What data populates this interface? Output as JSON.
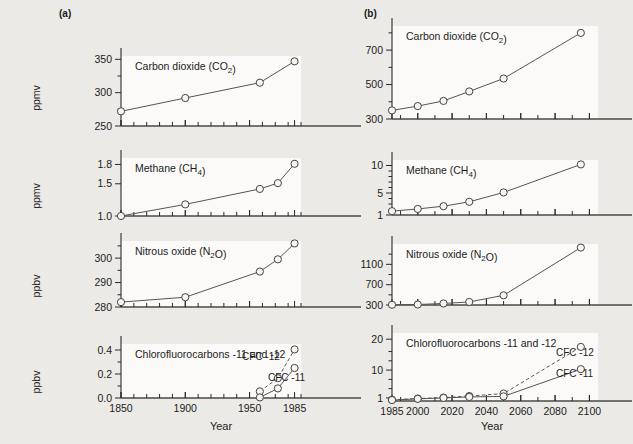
{
  "figure": {
    "panel_a_tag": "(a)",
    "panel_b_tag": "(b)",
    "xlabel": "Year"
  },
  "chart_data": [
    {
      "id": "a-co2",
      "type": "line",
      "panel": "(a)",
      "title": "Carbon dioxide (CO₂)",
      "xlabel": "Year",
      "ylabel": "ppmv",
      "xlim": [
        1850,
        1990
      ],
      "ylim": [
        250,
        355
      ],
      "yscale": "linear",
      "ytick_labels": [
        "250",
        "300",
        "350"
      ],
      "yticks": [
        250,
        300,
        350
      ],
      "yminor": [
        275,
        325
      ],
      "xtick_labels": [
        "1850",
        "1900",
        "1950",
        "1985"
      ],
      "xticks_labeled": [
        1850,
        1900,
        1950,
        1985
      ],
      "xminor": [
        1860,
        1870,
        1880,
        1890,
        1910,
        1920,
        1930,
        1940,
        1960,
        1970,
        1980
      ],
      "grid": false,
      "series": [
        {
          "name": "CO2",
          "style": "solid",
          "markers": true,
          "x": [
            1850,
            1900,
            1958,
            1985
          ],
          "values": [
            272,
            292,
            315,
            347
          ]
        }
      ]
    },
    {
      "id": "a-ch4",
      "type": "line",
      "panel": "(a)",
      "title": "Methane (CH₄)",
      "xlabel": "Year",
      "ylabel": "ppmv",
      "xlim": [
        1850,
        1990
      ],
      "ylim": [
        1.0,
        1.9
      ],
      "yscale": "linear",
      "ytick_labels": [
        "1.0",
        "1.5",
        "1.8"
      ],
      "yticks": [
        1.0,
        1.5,
        1.8
      ],
      "grid": false,
      "series": [
        {
          "name": "CH4",
          "style": "solid",
          "markers": true,
          "x": [
            1850,
            1900,
            1958,
            1972,
            1985
          ],
          "values": [
            1.0,
            1.18,
            1.42,
            1.51,
            1.81
          ]
        }
      ]
    },
    {
      "id": "a-n2o",
      "type": "line",
      "panel": "(a)",
      "title": "Nitrous oxide (N₂O)",
      "xlabel": "Year",
      "ylabel": "ppbv",
      "xlim": [
        1850,
        1990
      ],
      "ylim": [
        280,
        307
      ],
      "yscale": "linear",
      "ytick_labels": [
        "280",
        "290",
        "300"
      ],
      "yticks": [
        280,
        290,
        300
      ],
      "yminor": [
        285,
        295,
        305
      ],
      "grid": false,
      "series": [
        {
          "name": "N2O",
          "style": "solid",
          "markers": true,
          "x": [
            1850,
            1900,
            1958,
            1972,
            1985
          ],
          "values": [
            282,
            284,
            294.5,
            299.5,
            306
          ]
        }
      ]
    },
    {
      "id": "a-cfc",
      "type": "line",
      "panel": "(a)",
      "title": "Chlorofluorocarbons -11 and -12",
      "xlabel": "Year",
      "ylabel": "ppbv",
      "xlim": [
        1850,
        1990
      ],
      "ylim": [
        0.0,
        0.45
      ],
      "yscale": "linear",
      "ytick_labels": [
        "0.0",
        "0.2",
        "0.4"
      ],
      "yticks": [
        0.0,
        0.2,
        0.4
      ],
      "yminor": [
        0.1,
        0.3
      ],
      "grid": false,
      "series": [
        {
          "name": "CFC -12",
          "label": "CFC -12",
          "style": "dashed",
          "markers": true,
          "x": [
            1958,
            1972,
            1985
          ],
          "values": [
            0.055,
            0.165,
            0.405
          ]
        },
        {
          "name": "CFC -11",
          "label": "CFC -11",
          "style": "solid",
          "markers": true,
          "x": [
            1958,
            1972,
            1985
          ],
          "values": [
            0.005,
            0.08,
            0.25
          ]
        }
      ]
    },
    {
      "id": "b-co2",
      "type": "line",
      "panel": "(b)",
      "title": "Carbon dioxide (CO₂)",
      "xlabel": "Year",
      "ylabel": "",
      "xlim": [
        1985,
        2105
      ],
      "ylim": [
        300,
        840
      ],
      "yscale": "linear",
      "ytick_labels": [
        "300",
        "500",
        "700"
      ],
      "yticks": [
        300,
        500,
        700
      ],
      "yminor": [
        400,
        600,
        800
      ],
      "xtick_labels": [
        "1985",
        "2000",
        "2020",
        "2040",
        "2060",
        "2080",
        "2100"
      ],
      "xticks_labeled": [
        1985,
        2000,
        2020,
        2040,
        2060,
        2080,
        2100
      ],
      "grid": false,
      "series": [
        {
          "name": "CO2",
          "style": "solid",
          "markers": true,
          "x": [
            1985,
            2000,
            2015,
            2030,
            2050,
            2095
          ],
          "values": [
            350,
            375,
            405,
            460,
            535,
            800
          ]
        }
      ]
    },
    {
      "id": "b-ch4",
      "type": "line",
      "panel": "(b)",
      "title": "Methane (CH₄)",
      "xlabel": "Year",
      "ylabel": "",
      "xlim": [
        1985,
        2105
      ],
      "ylim": [
        1,
        11
      ],
      "yscale": "linear",
      "ytick_labels": [
        "1",
        "5",
        "10"
      ],
      "yticks": [
        1,
        5,
        10
      ],
      "yminor": [
        2,
        3,
        4,
        6,
        7,
        8,
        9
      ],
      "grid": false,
      "series": [
        {
          "name": "CH4",
          "style": "solid",
          "markers": true,
          "x": [
            1985,
            2000,
            2015,
            2030,
            2050,
            2095
          ],
          "values": [
            1.7,
            2.1,
            2.6,
            3.4,
            5.1,
            10.2
          ]
        }
      ]
    },
    {
      "id": "b-n2o",
      "type": "line",
      "panel": "(b)",
      "title": "Nitrous oxide (N₂O)",
      "xlabel": "Year",
      "ylabel": "",
      "xlim": [
        1985,
        2105
      ],
      "ylim": [
        300,
        1500
      ],
      "yscale": "linear",
      "ytick_labels": [
        "300",
        "700",
        "1100"
      ],
      "yticks": [
        300,
        700,
        1100
      ],
      "yminor": [
        500,
        900,
        1300
      ],
      "grid": false,
      "series": [
        {
          "name": "N2O",
          "style": "solid",
          "markers": true,
          "x": [
            1985,
            2000,
            2015,
            2030,
            2050,
            2095
          ],
          "values": [
            305,
            310,
            330,
            360,
            490,
            1430
          ]
        }
      ]
    },
    {
      "id": "b-cfc",
      "type": "line",
      "panel": "(b)",
      "title": "Chlorofluorocarbons -11 and -12",
      "xlabel": "Year",
      "ylabel": "",
      "xlim": [
        1985,
        2105
      ],
      "ylim": [
        0,
        22
      ],
      "yscale": "linear",
      "ytick_labels": [
        "1",
        "10",
        "20"
      ],
      "yticks": [
        1,
        10,
        20
      ],
      "yminor": [
        4,
        7,
        13,
        16
      ],
      "grid": false,
      "series": [
        {
          "name": "CFC -12",
          "label": "CFC -12",
          "style": "dashed",
          "markers": true,
          "x": [
            1985,
            2000,
            2015,
            2030,
            2050,
            2095
          ],
          "values": [
            0.4,
            0.8,
            1.1,
            1.6,
            2.4,
            17.5
          ]
        },
        {
          "name": "CFC -11",
          "label": "CFC -11",
          "style": "solid",
          "markers": true,
          "x": [
            1985,
            2000,
            2015,
            2030,
            2050,
            2095
          ],
          "values": [
            0.3,
            0.7,
            1.0,
            1.3,
            1.5,
            10.3
          ]
        }
      ]
    }
  ]
}
